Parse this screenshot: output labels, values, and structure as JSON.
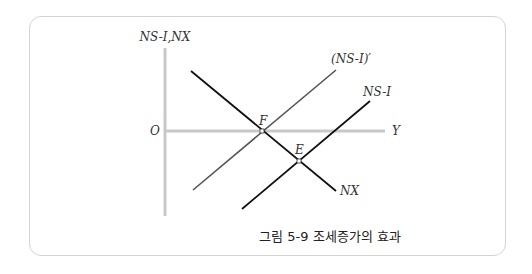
{
  "figure": {
    "y_axis_label": "NS-I,NX",
    "x_axis_label": "Y",
    "origin_label": "O",
    "curves": {
      "ns_i_prime": "(NS-I)′",
      "ns_i": "NS-I",
      "nx": "NX"
    },
    "points": {
      "f": "F",
      "e": "E"
    },
    "caption": "그림 5-9 조세증가의 효과"
  },
  "colors": {
    "axis": "#c8c8c8",
    "line_dark": "#111111",
    "line_gray": "#555555",
    "border": "#d4d4d4"
  }
}
